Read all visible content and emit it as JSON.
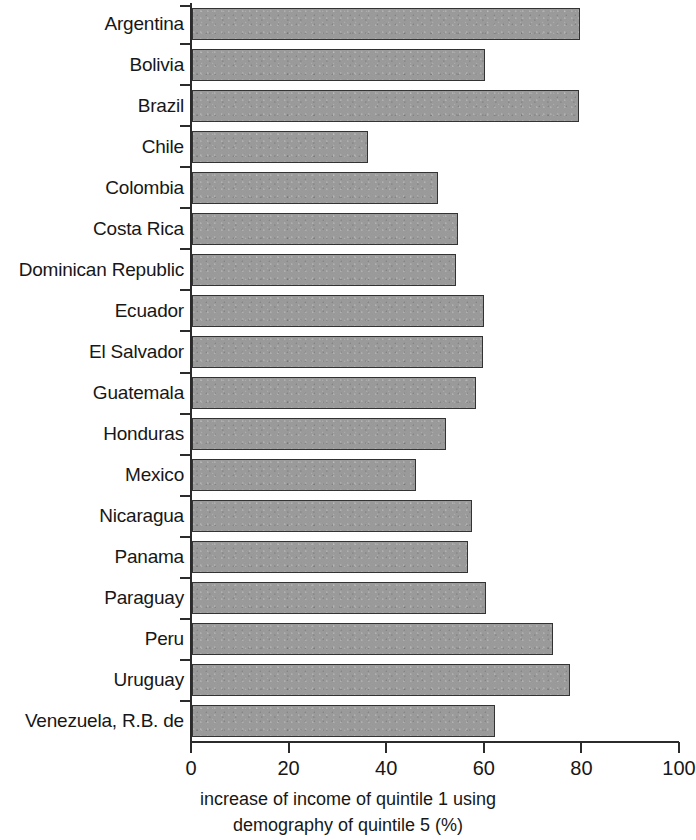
{
  "chart_data": {
    "type": "bar",
    "orientation": "horizontal",
    "title": "",
    "subtitle": "",
    "xlabel": "increase of income of quintile 1 using demography of quintile 5 (%)",
    "xlabel_lines": [
      "increase of income of quintile 1 using",
      "demography of quintile 5 (%)"
    ],
    "ylabel": "",
    "xlim": [
      0,
      100
    ],
    "xticks": [
      0,
      20,
      40,
      60,
      80,
      100
    ],
    "xtick_labels": [
      "0",
      "20",
      "40",
      "60",
      "80",
      "100"
    ],
    "grid": false,
    "legend": null,
    "bar_fill_color": "#9a9a9a",
    "bar_edge_color": "#333333",
    "axis_color": "#2b2b2b",
    "categories": [
      "Argentina",
      "Bolivia",
      "Brazil",
      "Chile",
      "Colombia",
      "Costa Rica",
      "Dominican Republic",
      "Ecuador",
      "El Salvador",
      "Guatemala",
      "Honduras",
      "Mexico",
      "Nicaragua",
      "Panama",
      "Paraguay",
      "Peru",
      "Uruguay",
      "Venezuela, R.B. de"
    ],
    "values": [
      79.5,
      60.0,
      79.3,
      36.0,
      50.4,
      54.5,
      54.1,
      59.8,
      59.6,
      58.2,
      52.0,
      45.9,
      57.4,
      56.6,
      60.2,
      74.0,
      77.5,
      62.1
    ]
  }
}
